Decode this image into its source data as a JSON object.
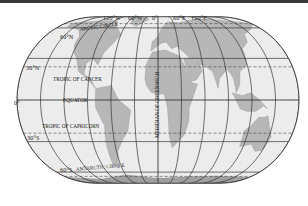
{
  "map": {
    "projection": "world-oval",
    "colors": {
      "ocean": "#ececec",
      "land": "#b7b7b7",
      "land_dark": "#9f9f9f",
      "grid": "#333333",
      "topbar": "#3a3a3a"
    },
    "meridian_labels": [
      "120°W",
      "60°W",
      "0°",
      "60°E",
      "120°E"
    ],
    "parallel_labels": {
      "n60": "60°N",
      "n30": "30°N",
      "eq": "0°",
      "s30": "30°S",
      "s60": "60°S"
    },
    "lines": {
      "arctic": "ARCTIC CIRCLE",
      "cancer": "TROPIC OF CANCER",
      "equator": "EQUATOR",
      "capricorn": "TROPIC OF CAPRICORN",
      "antarctic": "ANTARCTIC CIRCLE",
      "prime_meridian": "MERIDIAN OF GREENWICH"
    }
  }
}
